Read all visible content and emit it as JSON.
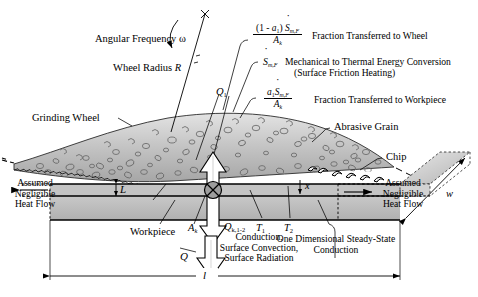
{
  "figure": {
    "colors": {
      "wheel_fill": "#b9b9b9",
      "wheel_light": "#d8d8d8",
      "workpiece_fill": "#bdbdbd",
      "workpiece_dark": "#a8a8a8",
      "side_block": "#c9c9c9",
      "line": "#000000",
      "white": "#ffffff"
    }
  },
  "labels": {
    "angular_frequency": "Angular Frequency ω",
    "wheel_radius": "Wheel Radius R",
    "wheel_radius_plain": "Wheel Radius",
    "wheel_radius_sym": "R",
    "grinding_wheel": "Grinding Wheel",
    "abrasive_grain": "Abrasive Grain",
    "chip": "Chip",
    "workpiece": "Workpiece",
    "assumed_negligible_heat_flow": "Assumed Negligible Heat Flow",
    "assumed_line1": "Assumed",
    "assumed_line2": "Negligible",
    "assumed_line3": "Heat Flow",
    "one_d_line1": "One Dimensional Steady-State",
    "one_d_line2": "Conduction",
    "conduction_line1": "Conduction,",
    "conduction_line2": "Surface Convection,",
    "conduction_line3": "Surface Radiation",
    "surface_friction": "(Surface Friction Heating)",
    "mech_to_thermal": "Mechanical to Thermal Energy Conversion",
    "fraction_wheel": "Fraction Transferred to Wheel",
    "fraction_workpiece": "Fraction Transferred to Workpiece",
    "x_axis_top": "x",
    "x_axis_right": "x"
  },
  "symbols": {
    "L": "L",
    "l": "l",
    "w": "w",
    "Q1": "Q",
    "Q1_sub": "1",
    "Q_k12": "Q",
    "Q_k12_sub": "k,1-2",
    "Q": "Q",
    "T1": "T",
    "T1_sub": "1",
    "T2": "T",
    "T2_sub": "2",
    "Ak": "A",
    "Ak_sub": "k",
    "Ak_bottom": "A",
    "Ak_bottom_sub": "k",
    "a1": "a",
    "a1_sub": "1",
    "S": "S",
    "S_sub": "m,F",
    "omega": "ω",
    "R": "R"
  },
  "equations": {
    "wheel_fraction": {
      "numerator": "(1 - a₁) Ṡₘ,ғ",
      "numerator_text": "(1 - a1) S m,F",
      "denominator": "A k",
      "description": "Fraction Transferred to Wheel"
    },
    "source": {
      "term": "Ṡ m,F",
      "description_line1": "Mechanical to Thermal Energy Conversion",
      "description_line2": "(Surface Friction Heating)"
    },
    "workpiece_fraction": {
      "numerator": "a₁ Ṡ m,F",
      "denominator": "A k",
      "description": "Fraction Transferred to Workpiece"
    }
  }
}
